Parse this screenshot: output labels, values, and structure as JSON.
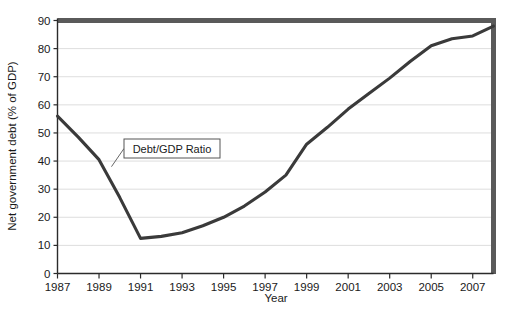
{
  "chart_data": {
    "type": "line",
    "title": "",
    "xlabel": "Year",
    "ylabel": "Net government debt (% of GDP)",
    "xlim": [
      1987,
      2008
    ],
    "ylim": [
      0,
      90
    ],
    "grid": true,
    "grid_axis": "y",
    "legend_position": "none",
    "series": [
      {
        "name": "Debt/GDP Ratio",
        "color": "#3a3a3a",
        "x": [
          1987,
          1988,
          1989,
          1990,
          1991,
          1992,
          1993,
          1994,
          1995,
          1996,
          1997,
          1998,
          1999,
          2000,
          2001,
          2002,
          2003,
          2004,
          2005,
          2006,
          2007,
          2008
        ],
        "values": [
          56.0,
          48.5,
          40.5,
          27.0,
          12.5,
          13.2,
          14.5,
          17.0,
          20.0,
          24.0,
          29.0,
          35.0,
          46.0,
          52.0,
          58.5,
          64.0,
          69.5,
          75.5,
          81.0,
          83.5,
          84.5,
          88.0
        ]
      }
    ],
    "x_ticks": [
      1987,
      1989,
      1991,
      1993,
      1995,
      1997,
      1999,
      2001,
      2003,
      2005,
      2007
    ],
    "x_tick_labels": [
      "1987",
      "1989",
      "1991",
      "1993",
      "1995",
      "1997",
      "1999",
      "2001",
      "2003",
      "2005",
      "2007"
    ],
    "y_ticks": [
      0,
      10,
      20,
      30,
      40,
      50,
      60,
      70,
      80,
      90
    ],
    "y_tick_labels": [
      "0",
      "10",
      "20",
      "30",
      "40",
      "50",
      "60",
      "70",
      "80",
      "90"
    ],
    "annotations": [
      {
        "text": "Debt/GDP Ratio",
        "points_to_x": 1989.6,
        "points_to_y": 38.0
      }
    ],
    "colors": {
      "line": "#3a3a3a",
      "axis": "#2b2b2b",
      "grid": "#d9d9d9",
      "frame_band": "#5a5a5a",
      "text": "#1a1a1a",
      "annotation_box_border": "#555555",
      "annotation_box_fill": "#ffffff",
      "background": "#ffffff"
    }
  }
}
